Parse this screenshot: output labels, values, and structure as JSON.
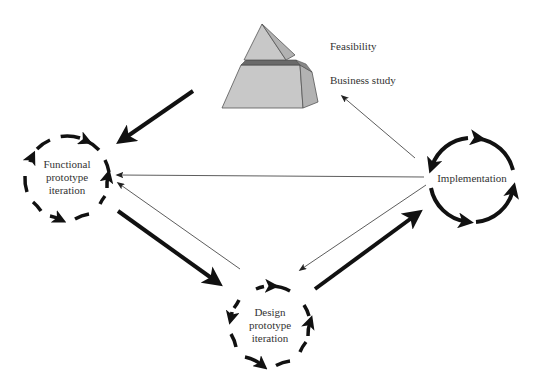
{
  "diagram": {
    "type": "DSDM lifecycle",
    "nodes": {
      "feasibility": {
        "label": "Feasibility"
      },
      "business_study": {
        "label": "Business study"
      },
      "functional": {
        "label_lines": [
          "Functional",
          "prototype",
          "iteration"
        ]
      },
      "design": {
        "label_lines": [
          "Design",
          "prototype",
          "iteration"
        ]
      },
      "implementation": {
        "label": "Implementation"
      }
    },
    "edges": [
      {
        "from": "business_study",
        "to": "functional",
        "weight": "thick"
      },
      {
        "from": "functional",
        "to": "design",
        "weight": "thick"
      },
      {
        "from": "design",
        "to": "implementation",
        "weight": "thick"
      },
      {
        "from": "implementation",
        "to": "business_study",
        "weight": "thin"
      },
      {
        "from": "implementation",
        "to": "functional",
        "weight": "thin"
      },
      {
        "from": "implementation",
        "to": "design",
        "weight": "thin"
      },
      {
        "from": "design",
        "to": "functional",
        "weight": "thin"
      }
    ],
    "colors": {
      "pyramid_face": "#c4c4c4",
      "pyramid_side": "#b0b0b0",
      "pyramid_band": "#666666",
      "stroke": "#111111"
    }
  }
}
